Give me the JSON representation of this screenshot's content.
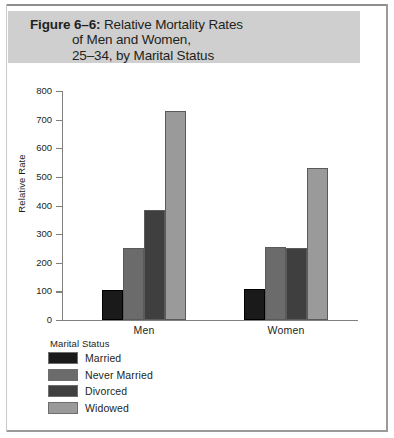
{
  "figure": {
    "label": "Figure 6–6:",
    "title_line1": "Relative Mortality Rates",
    "title_line2": "of Men and Women,",
    "title_line3": "25–34, by Marital Status",
    "band_color": "#cfcfcf"
  },
  "chart_data": {
    "type": "bar",
    "title": "Figure 6–6: Relative Mortality Rates of Men and Women, 25–34, by Marital Status",
    "xlabel": "",
    "ylabel": "Relative Rate",
    "categories": [
      "Men",
      "Women"
    ],
    "ylim": [
      0,
      800
    ],
    "yticks": [
      0,
      100,
      200,
      300,
      400,
      500,
      600,
      700,
      800
    ],
    "ytick_labels": [
      "0",
      "100",
      "200",
      "300",
      "400",
      "500",
      "600",
      "700",
      "800"
    ],
    "grid": false,
    "legend_title": "Marital Status",
    "legend_position": "below-left",
    "series": [
      {
        "name": "Married",
        "color": "#1a1a1a",
        "values": [
          105,
          110
        ]
      },
      {
        "name": "Never Married",
        "color": "#6b6b6b",
        "values": [
          250,
          255
        ]
      },
      {
        "name": "Divorced",
        "color": "#3f3f3f",
        "values": [
          385,
          250
        ]
      },
      {
        "name": "Widowed",
        "color": "#9a9a9a",
        "values": [
          730,
          530
        ]
      }
    ]
  }
}
